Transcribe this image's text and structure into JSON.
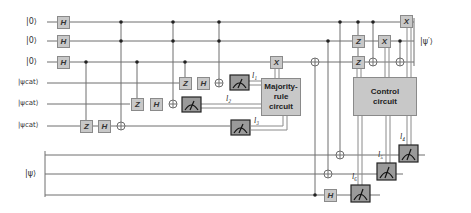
{
  "colors": {
    "wire": "#6e6e6e",
    "gate_fill": "#c8c8c8",
    "gate_border": "#8a8a8a",
    "meter_fill": "#9a9a9a",
    "meter_border": "#222222",
    "text": "#333333"
  },
  "inputs": {
    "ancilla_1": "|0⟩",
    "ancilla_2": "|0⟩",
    "ancilla_3": "|0⟩",
    "cat_1": "|ψcat⟩",
    "cat_2": "|ψcat⟩",
    "cat_3": "|ψcat⟩",
    "data": "|ψ⟩"
  },
  "output": {
    "label": "|ψ′⟩"
  },
  "gates": {
    "h_anc1": "H",
    "h_anc2": "H",
    "h_anc3": "H",
    "z_cat3": "Z",
    "h_cat3": "H",
    "z_cat2": "Z",
    "h_cat2": "H",
    "z_cat1": "Z",
    "h_cat1": "H",
    "x_anc3": "X",
    "z_anc2": "Z",
    "z_anc3": "Z",
    "x_anc2": "X",
    "x_anc1": "X",
    "h_data3": "H"
  },
  "boxes": {
    "majority": "Majority-rule circuit",
    "majority_lines": [
      "Majority-",
      "rule",
      "circuit"
    ],
    "control": "Control circuit",
    "control_lines": [
      "Control",
      "circuit"
    ]
  },
  "measurements": {
    "l1": "l₁",
    "l2": "l₂",
    "l3": "l₃",
    "l4": "l₄",
    "l5": "l₅",
    "l6": "l₆"
  }
}
